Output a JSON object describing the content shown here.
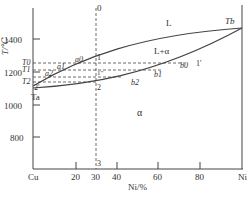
{
  "diagram": {
    "y_axis": {
      "label": "T/℃",
      "ticks": [
        "1400",
        "1200",
        "1000",
        "800"
      ],
      "marks": [
        "T0",
        "T1",
        "T2"
      ]
    },
    "x_axis": {
      "label": "Ni/%",
      "left_end": "Cu",
      "right_end": "Ni",
      "ticks": [
        "20",
        "30",
        "40",
        "60",
        "80"
      ]
    },
    "regions": {
      "liquid": "L",
      "two_phase": "L+α",
      "solid": "α"
    },
    "points": {
      "Ta": "Ta",
      "Tb": "Tb",
      "a0": "a0",
      "a1": "a1",
      "a2": "a2",
      "b0": "b0",
      "b1": "b1",
      "b2": "b2",
      "p0": "0",
      "p1": "1",
      "p1prime": "1'",
      "p2": "2",
      "p2prime": "2'",
      "p3": "3",
      "p1c": "1″"
    },
    "caption": "图 ... Cu-Ni 相图"
  }
}
